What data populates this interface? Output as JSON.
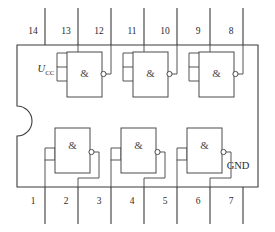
{
  "diagram": {
    "name": "quad-2-input-nand-ic-pinout",
    "package": {
      "type": "DIP-14",
      "pin_count": 14,
      "notch": "left-edge-semicircle"
    },
    "colors": {
      "background": "#ffffff",
      "outline": "#3a3a3a",
      "wire": "#555555",
      "gate_stroke": "#4a4a4a",
      "text": "#2b2b2b"
    },
    "labels": {
      "vcc_symbol": "U",
      "vcc_subscript": "CC",
      "gnd": "GND",
      "gate_symbol": "&"
    },
    "top_pins": [
      {
        "number": "14",
        "x": 33,
        "lead_x": 45
      },
      {
        "number": "13",
        "x": 66,
        "lead_x": 78
      },
      {
        "number": "12",
        "x": 99,
        "lead_x": 111
      },
      {
        "number": "11",
        "x": 132,
        "lead_x": 144
      },
      {
        "number": "10",
        "x": 165,
        "lead_x": 177
      },
      {
        "number": "9",
        "x": 198,
        "lead_x": 210
      },
      {
        "number": "8",
        "x": 231,
        "lead_x": 243
      }
    ],
    "bottom_pins": [
      {
        "number": "1",
        "x": 33,
        "lead_x": 45
      },
      {
        "number": "2",
        "x": 66,
        "lead_x": 78
      },
      {
        "number": "3",
        "x": 99,
        "lead_x": 111
      },
      {
        "number": "4",
        "x": 132,
        "lead_x": 144
      },
      {
        "number": "5",
        "x": 165,
        "lead_x": 177
      },
      {
        "number": "6",
        "x": 198,
        "lead_x": 210
      },
      {
        "number": "7",
        "x": 231,
        "lead_x": 243
      }
    ],
    "gates": [
      {
        "id": "gate-top-1",
        "symbol": "&",
        "inputs": [
          "13",
          "12"
        ],
        "output": "11",
        "row": "top"
      },
      {
        "id": "gate-top-2",
        "symbol": "&",
        "inputs": [
          "11",
          "10"
        ],
        "output": "9",
        "row": "top"
      },
      {
        "id": "gate-top-3",
        "symbol": "&",
        "inputs": [
          "9",
          "8"
        ],
        "output": "8",
        "row": "top"
      },
      {
        "id": "gate-bottom-1",
        "symbol": "&",
        "inputs": [
          "1",
          "2"
        ],
        "output": "3",
        "row": "bottom"
      },
      {
        "id": "gate-bottom-2",
        "symbol": "&",
        "inputs": [
          "4",
          "5"
        ],
        "output": "6",
        "row": "bottom"
      },
      {
        "id": "gate-bottom-3",
        "symbol": "&",
        "inputs": [
          "5",
          "6"
        ],
        "output": "7",
        "row": "bottom"
      }
    ]
  }
}
